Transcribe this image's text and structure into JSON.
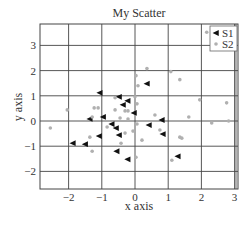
{
  "chart_data": {
    "type": "scatter",
    "title": "My Scatter",
    "xlabel": "x axis",
    "ylabel": "y axis",
    "xlim": [
      -2.85,
      3.05
    ],
    "ylim": [
      -2.7,
      3.85
    ],
    "xticks": [
      -2,
      -1,
      0,
      1,
      2,
      3
    ],
    "yticks": [
      -2,
      -1,
      0,
      1,
      2,
      3
    ],
    "grid": true,
    "legend_position": "upper right",
    "series": [
      {
        "name": "S1",
        "marker": "triangle-left",
        "color": "#111111",
        "points": [
          [
            -1.06,
            1.12
          ],
          [
            -0.48,
            0.96
          ],
          [
            -0.22,
            0.8
          ],
          [
            -0.36,
            0.64
          ],
          [
            0.36,
            1.48
          ],
          [
            -0.03,
            0.32
          ],
          [
            -1.36,
            0.08
          ],
          [
            -0.96,
            0.16
          ],
          [
            -0.7,
            -0.12
          ],
          [
            -0.57,
            -0.28
          ],
          [
            -0.48,
            -0.56
          ],
          [
            -1.08,
            -0.6
          ],
          [
            -1.87,
            -0.88
          ],
          [
            -1.5,
            -0.92
          ],
          [
            -0.55,
            -1.2
          ],
          [
            -0.22,
            -1.52
          ],
          [
            0.42,
            -0.16
          ],
          [
            0.81,
            0.04
          ],
          [
            0.84,
            -0.52
          ],
          [
            1.29,
            -1.4
          ]
        ]
      },
      {
        "name": "S2",
        "marker": "circle",
        "color": "#b0b0b0",
        "points": [
          [
            -2.55,
            -0.28
          ],
          [
            -2.04,
            0.44
          ],
          [
            -1.23,
            0.52
          ],
          [
            -1.11,
            0.52
          ],
          [
            -1.29,
            0.16
          ],
          [
            -1.36,
            -0.64
          ],
          [
            -1.29,
            -1.2
          ],
          [
            -0.84,
            -0.24
          ],
          [
            -0.6,
            0.92
          ],
          [
            -0.6,
            0.44
          ],
          [
            -0.3,
            0.4
          ],
          [
            -0.21,
            0.4
          ],
          [
            -0.45,
            0.12
          ],
          [
            -0.21,
            0.08
          ],
          [
            -0.3,
            -0.48
          ],
          [
            -0.42,
            -0.88
          ],
          [
            -0.06,
            -0.4
          ],
          [
            0.03,
            1.8
          ],
          [
            0.09,
            1.4
          ],
          [
            0.0,
            0.96
          ],
          [
            0.06,
            0.68
          ],
          [
            0.06,
            -0.12
          ],
          [
            0.03,
            -1.44
          ],
          [
            0.21,
            -0.76
          ],
          [
            0.36,
            2.08
          ],
          [
            0.6,
            0.24
          ],
          [
            0.75,
            -0.36
          ],
          [
            1.08,
            1.96
          ],
          [
            1.35,
            1.64
          ],
          [
            1.35,
            -0.64
          ],
          [
            1.41,
            -0.68
          ],
          [
            1.11,
            -1.56
          ],
          [
            1.62,
            0.16
          ],
          [
            1.95,
            0.84
          ],
          [
            2.16,
            3.52
          ],
          [
            2.31,
            -0.08
          ],
          [
            2.76,
            0.72
          ],
          [
            2.82,
            0.0
          ]
        ]
      }
    ]
  },
  "layout": {
    "plot_left": 40,
    "plot_right": 238,
    "plot_top": 24,
    "plot_bottom": 189,
    "x_zero_px": 135,
    "x_px_per_unit": 33.2,
    "y_zero_px": 121,
    "y_px_per_unit": 25.2,
    "grid_color": "#444444",
    "axis_color": "#444444"
  }
}
